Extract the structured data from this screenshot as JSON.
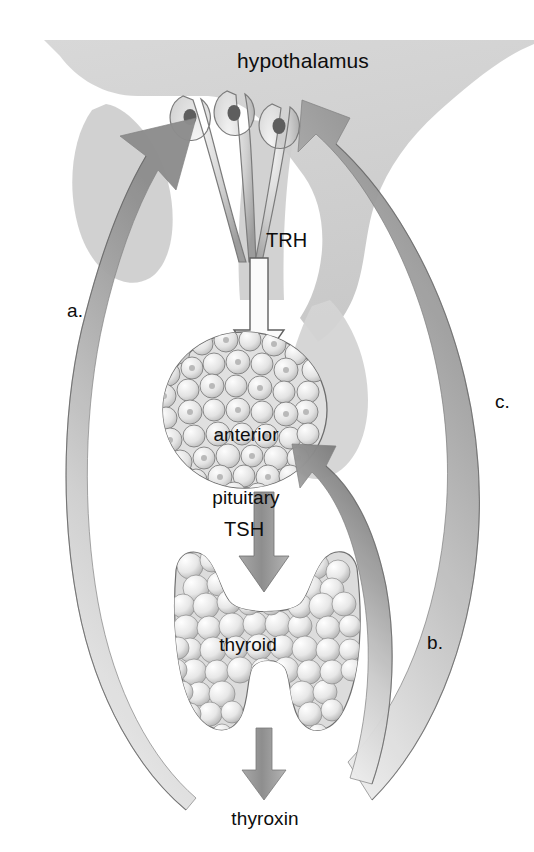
{
  "figure": {
    "background_color": "#ffffff",
    "brain_fill": "#d2d2d2",
    "arrow_fill": "#8f8f8f",
    "text_color": "#0d0d0d"
  },
  "labels": {
    "hypothalamus": "hypothalamus",
    "trh": "TRH",
    "anterior_pituitary_line1": "anterior",
    "anterior_pituitary_line2": "pituitary",
    "tsh": "TSH",
    "thyroid": "thyroid",
    "thyroxin": "thyroxin",
    "a": "a.",
    "b": "b.",
    "c": "c."
  },
  "structures": [
    {
      "name": "brain-silhouette",
      "kind": "anatomy",
      "fill": "#d2d2d2"
    },
    {
      "name": "neurosecretory-neurons",
      "kind": "anatomy",
      "count": 3
    },
    {
      "name": "anterior-pituitary-gland",
      "kind": "anatomy"
    },
    {
      "name": "thyroid-gland",
      "kind": "anatomy"
    }
  ],
  "arrows": [
    {
      "name": "trh-arrow",
      "label": "TRH",
      "style": "outline",
      "from": "hypothalamus",
      "to": "anterior pituitary",
      "direction": "down"
    },
    {
      "name": "tsh-arrow",
      "label": "TSH",
      "style": "solid",
      "from": "anterior pituitary",
      "to": "thyroid",
      "direction": "down"
    },
    {
      "name": "thyroxin-arrow",
      "label": "thyroxin",
      "style": "solid",
      "from": "thyroid",
      "to": "thyroxin",
      "direction": "down"
    },
    {
      "name": "feedback-arrow-a",
      "label": "a.",
      "style": "curved",
      "from": "thyroxin",
      "to": "hypothalamus",
      "side": "left"
    },
    {
      "name": "feedback-arrow-b",
      "label": "b.",
      "style": "curved",
      "from": "thyroxin",
      "to": "anterior pituitary",
      "side": "right-inner"
    },
    {
      "name": "feedback-arrow-c",
      "label": "c.",
      "style": "curved",
      "from": "thyroxin",
      "to": "hypothalamus",
      "side": "right-outer"
    }
  ]
}
